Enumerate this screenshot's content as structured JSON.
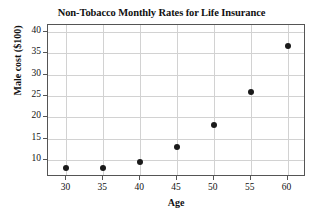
{
  "chart_data": {
    "type": "scatter",
    "title": "Non-Tobacco Monthly Rates for Life Insurance",
    "xlabel": "Age",
    "ylabel": "Male cost ($100)",
    "x": [
      30,
      35,
      40,
      45,
      50,
      55,
      60
    ],
    "values": [
      8.0,
      8.0,
      9.5,
      13.1,
      18.2,
      25.8,
      36.7
    ],
    "series": [
      {
        "name": "Male cost",
        "points": [
          {
            "x": 30,
            "y": 8.0
          },
          {
            "x": 35,
            "y": 8.0
          },
          {
            "x": 40,
            "y": 9.5
          },
          {
            "x": 45,
            "y": 13.1
          },
          {
            "x": 50,
            "y": 18.2
          },
          {
            "x": 55,
            "y": 25.8
          },
          {
            "x": 60,
            "y": 36.7
          }
        ]
      }
    ],
    "xticks": [
      30,
      35,
      40,
      45,
      50,
      55,
      60
    ],
    "xtick_labels": [
      "30",
      "35",
      "40",
      "45",
      "50",
      "55",
      "60"
    ],
    "yticks": [
      10,
      15,
      20,
      25,
      30,
      35,
      40
    ],
    "ytick_labels": [
      "10",
      "15",
      "20",
      "25",
      "30",
      "35",
      "40"
    ],
    "xlim": [
      27.5,
      62.5
    ],
    "ylim": [
      6.0,
      41.6
    ],
    "grid": true,
    "legend": false,
    "marker_color": "#1a1a1a",
    "grid_color": "#d2d2d2",
    "axis_color": "#555555"
  }
}
